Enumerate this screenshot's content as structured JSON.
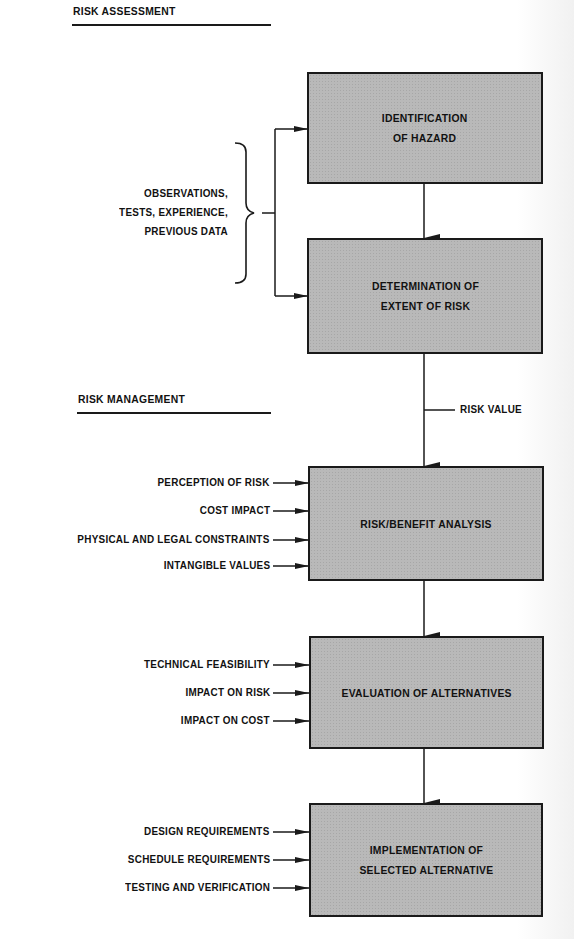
{
  "sections": {
    "assessment": {
      "title": "RISK ASSESSMENT"
    },
    "management": {
      "title": "RISK MANAGEMENT"
    }
  },
  "boxes": [
    {
      "id": "identification",
      "label": "IDENTIFICATION\nOF HAZARD"
    },
    {
      "id": "determination",
      "label": "DETERMINATION OF\nEXTENT OF RISK"
    },
    {
      "id": "risk-benefit",
      "label": "RISK/BENEFIT ANALYSIS"
    },
    {
      "id": "evaluation",
      "label": "EVALUATION OF ALTERNATIVES"
    },
    {
      "id": "implementation",
      "label": "IMPLEMENTATION OF\nSELECTED ALTERNATIVE"
    }
  ],
  "assessment_inputs": {
    "label": "OBSERVATIONS,\nTESTS, EXPERIENCE,\nPREVIOUS DATA"
  },
  "flow_labels": {
    "risk_value": "RISK VALUE"
  },
  "risk_benefit_inputs": [
    "PERCEPTION OF RISK",
    "COST IMPACT",
    "PHYSICAL AND LEGAL CONSTRAINTS",
    "INTANGIBLE VALUES"
  ],
  "evaluation_inputs": [
    "TECHNICAL FEASIBILITY",
    "IMPACT ON RISK",
    "IMPACT ON COST"
  ],
  "implementation_inputs": [
    "DESIGN REQUIREMENTS",
    "SCHEDULE REQUIREMENTS",
    "TESTING AND VERIFICATION"
  ],
  "colors": {
    "box_fill": "#b9b9b9",
    "line": "#1a1a1a",
    "background": "#ffffff"
  }
}
